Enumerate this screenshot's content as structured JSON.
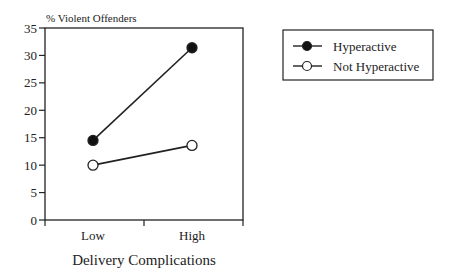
{
  "chart_data": {
    "type": "line",
    "title": "",
    "ylabel": "% Violent Offenders",
    "xlabel": "Delivery Complications",
    "categories": [
      "Low",
      "High"
    ],
    "ylim": [
      0,
      35
    ],
    "yticks": [
      0,
      5,
      10,
      15,
      20,
      25,
      30,
      35
    ],
    "grid": false,
    "legend_position": "top-right-outside",
    "series": [
      {
        "name": "Hyperactive",
        "marker": "filled-circle",
        "values": [
          14.5,
          31.4
        ]
      },
      {
        "name": "Not Hyperactive",
        "marker": "open-circle",
        "values": [
          10.0,
          13.6
        ]
      }
    ]
  }
}
